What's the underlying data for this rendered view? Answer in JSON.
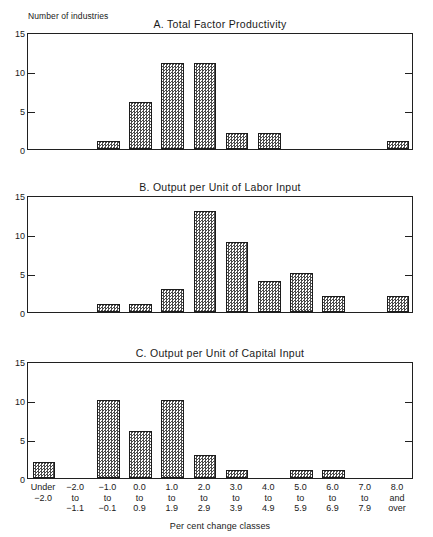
{
  "figure": {
    "y_axis_caption": "Number of industries",
    "x_axis_title": "Per cent change classes",
    "y_ticks": [
      "15",
      "10",
      "5",
      "0"
    ],
    "y_tick_values": [
      15,
      10,
      5,
      0
    ],
    "categories": [
      {
        "line1": "Under",
        "line2": "−2.0",
        "line3": ""
      },
      {
        "line1": "−2.0",
        "line2": "to",
        "line3": "−1.1"
      },
      {
        "line1": "−1.0",
        "line2": "to",
        "line3": "−0.1"
      },
      {
        "line1": "0.0",
        "line2": "to",
        "line3": "0.9"
      },
      {
        "line1": "1.0",
        "line2": "to",
        "line3": "1.9"
      },
      {
        "line1": "2.0",
        "line2": "to",
        "line3": "2.9"
      },
      {
        "line1": "3.0",
        "line2": "to",
        "line3": "3.9"
      },
      {
        "line1": "4.0",
        "line2": "to",
        "line3": "4.9"
      },
      {
        "line1": "5.0",
        "line2": "to",
        "line3": "5.9"
      },
      {
        "line1": "6.0",
        "line2": "to",
        "line3": "6.9"
      },
      {
        "line1": "7.0",
        "line2": "to",
        "line3": "7.9"
      },
      {
        "line1": "8.0",
        "line2": "and",
        "line3": "over"
      }
    ],
    "panels": [
      {
        "id": "A",
        "title": "A.  Total Factor Productivity"
      },
      {
        "id": "B",
        "title": "B.  Output per Unit of Labor Input"
      },
      {
        "id": "C",
        "title": "C.  Output per Unit of Capital Input"
      }
    ]
  },
  "chart_data": [
    {
      "type": "bar",
      "title": "A.  Total Factor Productivity",
      "xlabel": "Per cent change classes",
      "ylabel": "Number of industries",
      "ylim": [
        0,
        15
      ],
      "yticks": [
        0,
        5,
        10,
        15
      ],
      "grid": false,
      "legend": "none",
      "categories": [
        "Under -2.0",
        "-2.0 to -1.1",
        "-1.0 to -0.1",
        "0.0 to 0.9",
        "1.0 to 1.9",
        "2.0 to 2.9",
        "3.0 to 3.9",
        "4.0 to 4.9",
        "5.0 to 5.9",
        "6.0 to 6.9",
        "7.0 to 7.9",
        "8.0 and over"
      ],
      "values": [
        0,
        0,
        1,
        6,
        11,
        11,
        2,
        2,
        0,
        0,
        0,
        1
      ]
    },
    {
      "type": "bar",
      "title": "B.  Output per Unit of Labor Input",
      "xlabel": "Per cent change classes",
      "ylabel": "Number of industries",
      "ylim": [
        0,
        15
      ],
      "yticks": [
        0,
        5,
        10,
        15
      ],
      "grid": false,
      "legend": "none",
      "categories": [
        "Under -2.0",
        "-2.0 to -1.1",
        "-1.0 to -0.1",
        "0.0 to 0.9",
        "1.0 to 1.9",
        "2.0 to 2.9",
        "3.0 to 3.9",
        "4.0 to 4.9",
        "5.0 to 5.9",
        "6.0 to 6.9",
        "7.0 to 7.9",
        "8.0 and over"
      ],
      "values": [
        0,
        0,
        1,
        1,
        3,
        13,
        9,
        4,
        5,
        2,
        0,
        2
      ]
    },
    {
      "type": "bar",
      "title": "C.  Output per Unit of Capital Input",
      "xlabel": "Per cent change classes",
      "ylabel": "Number of industries",
      "ylim": [
        0,
        15
      ],
      "yticks": [
        0,
        5,
        10,
        15
      ],
      "grid": false,
      "legend": "none",
      "categories": [
        "Under -2.0",
        "-2.0 to -1.1",
        "-1.0 to -0.1",
        "0.0 to 0.9",
        "1.0 to 1.9",
        "2.0 to 2.9",
        "3.0 to 3.9",
        "4.0 to 4.9",
        "5.0 to 5.9",
        "6.0 to 6.9",
        "7.0 to 7.9",
        "8.0 and over"
      ],
      "values": [
        2,
        0,
        10,
        6,
        10,
        3,
        1,
        0,
        1,
        1,
        0,
        0
      ]
    }
  ]
}
